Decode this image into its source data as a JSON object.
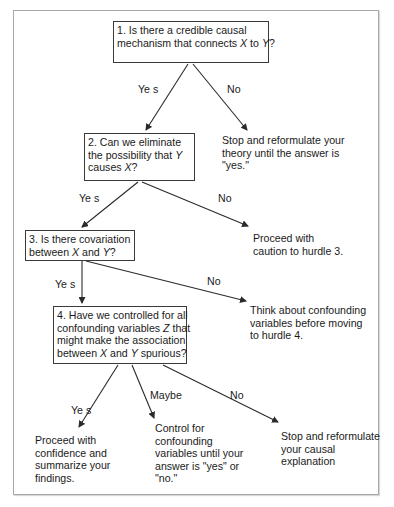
{
  "diagram": {
    "type": "decision-flowchart",
    "questions": [
      {
        "id": "q1",
        "lines": [
          {
            "segments": [
              {
                "t": "1. Is there a credible causal",
                "i": false
              }
            ]
          },
          {
            "segments": [
              {
                "t": "mechanism that connects ",
                "i": false
              },
              {
                "t": "X",
                "i": true
              },
              {
                "t": " to ",
                "i": false
              },
              {
                "t": "Y",
                "i": true
              },
              {
                "t": "?",
                "i": false
              }
            ]
          }
        ]
      },
      {
        "id": "q2",
        "lines": [
          {
            "segments": [
              {
                "t": "2. Can we eliminate",
                "i": false
              }
            ]
          },
          {
            "segments": [
              {
                "t": "the possibility that ",
                "i": false
              },
              {
                "t": "Y",
                "i": true
              }
            ]
          },
          {
            "segments": [
              {
                "t": "causes ",
                "i": false
              },
              {
                "t": "X",
                "i": true
              },
              {
                "t": "?",
                "i": false
              }
            ]
          }
        ]
      },
      {
        "id": "q3",
        "lines": [
          {
            "segments": [
              {
                "t": "3. Is there covariation",
                "i": false
              }
            ]
          },
          {
            "segments": [
              {
                "t": "between ",
                "i": false
              },
              {
                "t": "X",
                "i": true
              },
              {
                "t": " and ",
                "i": false
              },
              {
                "t": "Y",
                "i": true
              },
              {
                "t": "?",
                "i": false
              }
            ]
          }
        ]
      },
      {
        "id": "q4",
        "lines": [
          {
            "segments": [
              {
                "t": "4. Have we controlled for all",
                "i": false
              }
            ]
          },
          {
            "segments": [
              {
                "t": "confounding variables ",
                "i": false
              },
              {
                "t": "Z",
                "i": true
              },
              {
                "t": " that",
                "i": false
              }
            ]
          },
          {
            "segments": [
              {
                "t": "might make the association",
                "i": false
              }
            ]
          },
          {
            "segments": [
              {
                "t": "between ",
                "i": false
              },
              {
                "t": "X",
                "i": true
              },
              {
                "t": " and ",
                "i": false
              },
              {
                "t": "Y",
                "i": true
              },
              {
                "t": " spurious?",
                "i": false
              }
            ]
          }
        ]
      }
    ],
    "outcomes": {
      "q1_no": [
        "Stop and reformulate your",
        "theory until the answer is",
        "\"yes.\""
      ],
      "q2_no": [
        "Proceed with",
        "caution to hurdle 3."
      ],
      "q3_no": [
        "Think about confounding",
        "variables before moving",
        "to hurdle 4."
      ],
      "q4_yes": [
        "Proceed with",
        "confidence and",
        "summarize your",
        "findings."
      ],
      "q4_maybe": [
        "Control for",
        "confounding",
        "variables until your",
        "answer is \"yes\" or",
        "\"no.\""
      ],
      "q4_no": [
        "Stop and reformulate",
        "your causal",
        "explanation"
      ]
    },
    "edge_labels": {
      "q1_yes": "Ye s",
      "q1_no": "No",
      "q2_yes": "Ye s",
      "q2_no": "No",
      "q3_yes": "Ye s",
      "q3_no": "No",
      "q4_yes": "Ye s",
      "q4_maybe": "Maybe",
      "q4_no": "No"
    },
    "colors": {
      "line": "#2a2a2a",
      "box_border": "#3a3a3a",
      "frame_border": "#a8a8a8",
      "text": "#1a1a1a",
      "background": "#ffffff"
    }
  }
}
